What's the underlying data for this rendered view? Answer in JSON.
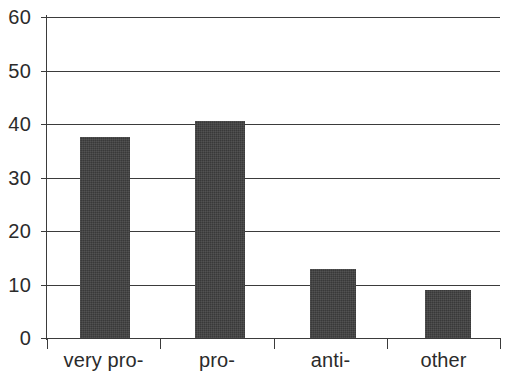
{
  "chart_data": {
    "type": "bar",
    "title": "",
    "subtitle": "",
    "xlabel": "",
    "ylabel": "",
    "categories": [
      "very pro-",
      "pro-",
      "anti-",
      "other"
    ],
    "values": [
      37.5,
      40.5,
      13,
      9
    ],
    "ylim": [
      0,
      60
    ],
    "yticks": [
      0,
      10,
      20,
      30,
      40,
      50,
      60
    ],
    "ytick_labels": [
      "0",
      "10",
      "20",
      "30",
      "40",
      "50",
      "60"
    ],
    "grid": true,
    "grid_axis": "y",
    "legend": false,
    "legend_position": "none",
    "bar_color": "#3f3f3f",
    "axis_color": "#3b3b3b",
    "text_color": "#2b2b2b",
    "background": "#ffffff"
  }
}
